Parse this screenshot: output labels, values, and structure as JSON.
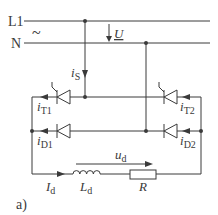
{
  "diagram": {
    "panel_label": "a)",
    "supply": {
      "line_label": "L1",
      "neutral_label": "N",
      "ac_symbol": "~",
      "voltage_label": "U"
    },
    "currents": {
      "source": {
        "sym": "i",
        "sub": "S"
      },
      "t1": {
        "sym": "i",
        "sub": "T1"
      },
      "t2": {
        "sym": "i",
        "sub": "T2"
      },
      "d1": {
        "sym": "i",
        "sub": "D1"
      },
      "d2": {
        "sym": "i",
        "sub": "D2"
      },
      "load": {
        "sym": "I",
        "sub": "d"
      }
    },
    "load": {
      "voltage": {
        "sym": "u",
        "sub": "d"
      },
      "inductor": {
        "sym": "L",
        "sub": "d"
      },
      "resistor": "R"
    },
    "colors": {
      "wire": "#3a3a3a",
      "background": "#ffffff"
    }
  }
}
